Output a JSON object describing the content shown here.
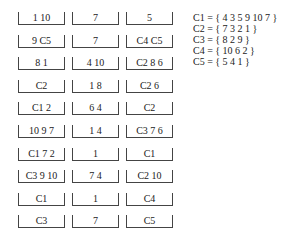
{
  "grid": {
    "rows": [
      [
        "1 10",
        "7",
        "5"
      ],
      [
        "9 C5",
        "7",
        "C4 C5"
      ],
      [
        "8 1",
        "4 10",
        "C2 8 6"
      ],
      [
        "C2",
        "1 8",
        "C2 6"
      ],
      [
        "C1 2",
        "6 4",
        "C2"
      ],
      [
        "10 9 7",
        "1 4",
        "C3 7 6"
      ],
      [
        "C1 7 2",
        "1",
        "C1"
      ],
      [
        "C3 9 10",
        "7 4",
        "C2 10"
      ],
      [
        "C1",
        "1",
        "C4"
      ],
      [
        "C3",
        "7",
        "C5"
      ]
    ]
  },
  "legend": [
    "C1 = { 4 3 5 9 10 7 }",
    "C2 = { 7 3 2 1 }",
    "C3 = { 8 2 9 }",
    "C4 = { 10 6 2 }",
    "C5 = { 5 4 1 }"
  ]
}
